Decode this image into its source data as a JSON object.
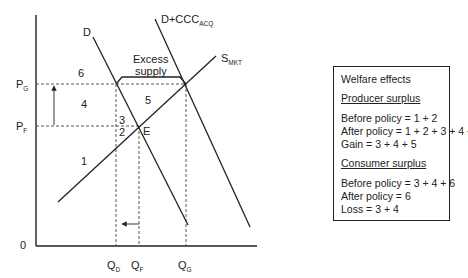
{
  "diagram": {
    "axes": {
      "origin_label": "0",
      "price_labels": [
        {
          "main": "P",
          "sub": "G"
        },
        {
          "main": "P",
          "sub": "F"
        }
      ],
      "quantity_labels": [
        {
          "main": "Q",
          "sub": "D"
        },
        {
          "main": "Q",
          "sub": "F"
        },
        {
          "main": "Q",
          "sub": "G"
        }
      ]
    },
    "curves": {
      "demand": "D",
      "demand_plus_ccc": {
        "main": "D+CCC",
        "sub": "ACQ"
      },
      "supply": {
        "main": "S",
        "sub": "MKT"
      }
    },
    "equilibrium_point": "E",
    "excess_supply_label": [
      "Excess",
      "supply"
    ],
    "areas": [
      "1",
      "2",
      "3",
      "4",
      "5",
      "6"
    ],
    "colors": {
      "line": "#222222",
      "background": "#ffffff"
    }
  },
  "welfare_box": {
    "title": "Welfare effects",
    "producer": {
      "heading": "Producer surplus",
      "lines": [
        "Before policy = 1 + 2",
        "After policy = 1 + 2 + 3 + 4 + 5",
        "Gain = 3 + 4 + 5"
      ]
    },
    "consumer": {
      "heading": "Consumer surplus",
      "lines": [
        "Before policy = 3 + 4 + 6",
        "After policy = 6",
        "Loss = 3 + 4"
      ]
    }
  }
}
